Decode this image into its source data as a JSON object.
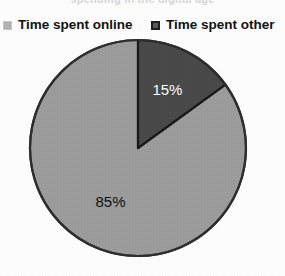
{
  "figure": {
    "clipped_caption_above": "spending in the digital age",
    "background_color": "#ffffff"
  },
  "legend": {
    "position": "top",
    "items": [
      {
        "label": "Time spent online",
        "swatch_name": "legend-swatch-online",
        "color": "#b4b4b4"
      },
      {
        "label": "Time spent other",
        "swatch_name": "legend-swatch-other",
        "color": "#4a4a4a"
      }
    ]
  },
  "chart_data": {
    "type": "pie",
    "title": "",
    "subtitle": "",
    "xlabel": "",
    "ylabel": "",
    "legend_position": "top",
    "grid": false,
    "start_angle_deg": 0,
    "direction": "clockwise",
    "categories": [
      "Time spent online",
      "Time spent other"
    ],
    "values": [
      85,
      15
    ],
    "unit": "%",
    "slices": [
      {
        "name": "Time spent online",
        "value": 85,
        "label": "85%",
        "color": "#9d9d9d",
        "outline_color": "#3a3a3a",
        "label_color": "#101010",
        "start_angle_deg": 54,
        "end_angle_deg": 360
      },
      {
        "name": "Time spent other",
        "value": 15,
        "label": "15%",
        "color": "#4a4a4a",
        "outline_color": "#1a1a1a",
        "label_color": "#ffffff",
        "start_angle_deg": 0,
        "end_angle_deg": 54
      }
    ]
  },
  "labels": {
    "slice_other_pct": "15%",
    "slice_online_pct": "85%"
  }
}
